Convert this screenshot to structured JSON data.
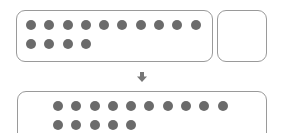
{
  "diagram": {
    "top_group": {
      "dot_count": 14,
      "per_row": 10
    },
    "small_box": {
      "dot_count": 0
    },
    "arrow": {
      "direction": "down",
      "icon": "down-arrow-icon"
    },
    "bottom_group": {
      "dot_count": 15,
      "per_row": 10
    },
    "colors": {
      "dot": "#6b6b6b",
      "border": "#9a9a9a",
      "arrow": "#777777"
    }
  }
}
